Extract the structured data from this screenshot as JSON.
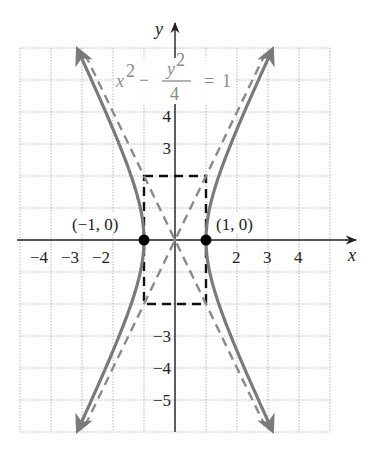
{
  "diagram": {
    "equation": {
      "lhs_term1": "x",
      "lhs_term1_exp": "2",
      "minus": "−",
      "frac_num": "y",
      "frac_num_exp": "2",
      "frac_den": "4",
      "equals": "=",
      "rhs": "1"
    },
    "axes": {
      "x_label": "x",
      "y_label": "y"
    },
    "x_ticks": [
      {
        "value": -4,
        "label": "−4"
      },
      {
        "value": -3,
        "label": "−3"
      },
      {
        "value": -2,
        "label": "−2"
      },
      {
        "value": 2,
        "label": "2"
      },
      {
        "value": 3,
        "label": "3"
      },
      {
        "value": 4,
        "label": "4"
      }
    ],
    "y_ticks": [
      {
        "value": 4,
        "label": "4"
      },
      {
        "value": 3,
        "label": "3"
      },
      {
        "value": -3,
        "label": "−3"
      },
      {
        "value": -4,
        "label": "−4"
      },
      {
        "value": -5,
        "label": "−5"
      }
    ],
    "vertices": [
      {
        "x": -1,
        "y": 0,
        "label": "(−1, 0)"
      },
      {
        "x": 1,
        "y": 0,
        "label": "(1, 0)"
      }
    ],
    "rectangle": {
      "x_min": -1,
      "x_max": 1,
      "y_min": -2,
      "y_max": 2
    },
    "asymptotes": [
      "y = 2x",
      "y = −2x"
    ],
    "grid": {
      "x_range": [
        -5,
        5
      ],
      "y_range": [
        -6,
        6
      ],
      "step": 1
    },
    "colors": {
      "curve": "#7a7a7a",
      "asymptote": "#8a8a8a",
      "rectangle": "#111111",
      "axis": "#222222",
      "grid": "#b5b5b5",
      "equation": "#8a8a8a",
      "point": "#000000"
    }
  }
}
